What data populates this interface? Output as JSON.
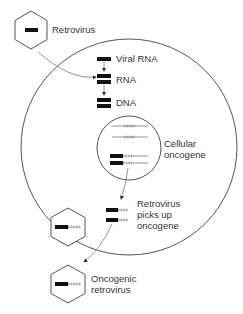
{
  "diagram": {
    "labels": {
      "retrovirus": "Retrovirus",
      "viral_rna": "Viral RNA",
      "rna": "RNA",
      "dna": "DNA",
      "cellular_line1": "Cellular",
      "cellular_line2": "oncogene",
      "picks_line1": "Retrovirus",
      "picks_line2": "picks up",
      "picks_line3": "oncogene",
      "oncogenic_line1": "Oncogenic",
      "oncogenic_line2": "retrovirus"
    },
    "colors": {
      "outline": "#555555",
      "viral_gene": "#111111",
      "oncogene": "#9a9a9a",
      "text": "#333333"
    },
    "steps": [
      "Retrovirus",
      "Viral RNA",
      "RNA",
      "DNA",
      "Cellular oncogene",
      "Retrovirus picks up oncogene",
      "Oncogenic retrovirus"
    ]
  }
}
